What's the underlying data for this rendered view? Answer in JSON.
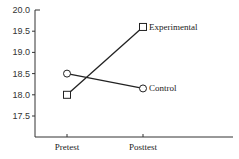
{
  "chart_data": {
    "type": "line",
    "title": "",
    "xlabel": "",
    "ylabel": "",
    "categories": [
      "Pretest",
      "Posttest"
    ],
    "series": [
      {
        "name": "Experimental",
        "marker": "square",
        "values": [
          18.0,
          19.6
        ]
      },
      {
        "name": "Control",
        "marker": "circle",
        "values": [
          18.5,
          18.15
        ]
      }
    ],
    "ylim": [
      17.0,
      20.0
    ],
    "yticks": [
      "20.0",
      "19.5",
      "19.0",
      "18.5",
      "18.0",
      "17.5"
    ],
    "ytick_values": [
      20.0,
      19.5,
      19.0,
      18.5,
      18.0,
      17.5
    ],
    "grid": false,
    "legend": "direct labels at line ends"
  },
  "colors": {
    "line": "#222222",
    "axis": "#333333",
    "background": "#ffffff"
  }
}
